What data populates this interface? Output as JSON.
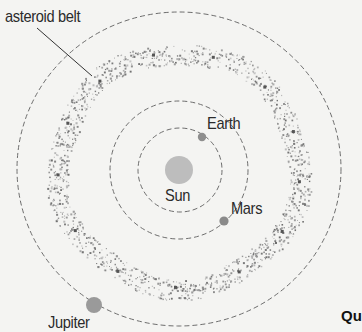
{
  "diagram": {
    "labels": {
      "asteroid_belt": "asteroid belt",
      "earth": "Earth",
      "sun": "Sun",
      "mars": "Mars",
      "jupiter": "Jupiter"
    },
    "question_fragment": "Qu",
    "colors": {
      "background": "#f4f4f2",
      "orbit": "#6d6d6d",
      "sun": "#bdbdbd",
      "planet": "#8e8e8e",
      "asteroid": "#8a8a8a",
      "text": "#2b2b2b"
    },
    "bodies": [
      {
        "name": "Sun",
        "cx": 179,
        "cy": 170,
        "r": 14
      },
      {
        "name": "Earth",
        "cx": 202,
        "cy": 137,
        "r": 4,
        "orbit_r": 42
      },
      {
        "name": "Mars",
        "cx": 224,
        "cy": 221,
        "r": 4.5,
        "orbit_r": 69
      },
      {
        "name": "Jupiter",
        "cx": 94,
        "cy": 305,
        "r": 8,
        "orbit_r": 160
      }
    ],
    "asteroid_belt": {
      "inner_r": 107,
      "outer_r": 128
    }
  }
}
